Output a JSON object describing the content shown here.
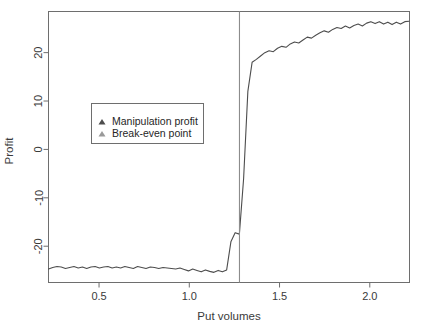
{
  "chart_data": {
    "type": "line",
    "title": "",
    "xlabel": "Put volumes",
    "ylabel": "Profit",
    "xlim": [
      0.22,
      2.22
    ],
    "ylim": [
      -27.5,
      28.5
    ],
    "xticks": [
      0.5,
      1.0,
      1.5,
      2.0
    ],
    "xtick_labels": [
      "0.5",
      "1.0",
      "1.5",
      "2.0"
    ],
    "yticks": [
      -20,
      -10,
      0,
      10,
      20
    ],
    "ytick_labels": [
      "-20",
      "-10",
      "0",
      "10",
      "20"
    ],
    "grid": false,
    "legend_position": "center-left",
    "series": [
      {
        "name": "Manipulation profit",
        "marker": "triangle",
        "color": "#4d4d4d",
        "x": [
          0.22,
          0.2435,
          0.267,
          0.2905,
          0.314,
          0.3375,
          0.361,
          0.3845,
          0.408,
          0.4315,
          0.455,
          0.4785,
          0.502,
          0.5255,
          0.549,
          0.5725,
          0.596,
          0.6195,
          0.643,
          0.6665,
          0.69,
          0.7135,
          0.737,
          0.7605,
          0.784,
          0.8075,
          0.831,
          0.8545,
          0.878,
          0.9015,
          0.925,
          0.9485,
          0.972,
          0.9955,
          1.019,
          1.0425,
          1.066,
          1.0895,
          1.113,
          1.1365,
          1.16,
          1.1835,
          1.207,
          1.2305,
          1.254,
          1.2775,
          1.301,
          1.3245,
          1.348,
          1.3715,
          1.395,
          1.4185,
          1.442,
          1.4655,
          1.489,
          1.5125,
          1.536,
          1.5595,
          1.583,
          1.6065,
          1.63,
          1.6535,
          1.677,
          1.7005,
          1.724,
          1.7475,
          1.771,
          1.7945,
          1.818,
          1.8415,
          1.865,
          1.8885,
          1.912,
          1.9355,
          1.959,
          1.9825,
          2.006,
          2.0295,
          2.053,
          2.0765,
          2.1,
          2.1235,
          2.147,
          2.1705,
          2.194,
          2.2175
        ],
        "y": [
          -24.7,
          -24.4,
          -24.2,
          -24.3,
          -24.6,
          -24.4,
          -24.2,
          -24.5,
          -24.3,
          -24.6,
          -24.3,
          -24.2,
          -24.5,
          -24.3,
          -24.2,
          -24.5,
          -24.3,
          -24.5,
          -24.2,
          -24.4,
          -24.6,
          -24.2,
          -24.4,
          -24.6,
          -24.3,
          -24.4,
          -24.6,
          -24.4,
          -24.5,
          -24.6,
          -24.7,
          -24.5,
          -24.8,
          -25.1,
          -24.7,
          -25.0,
          -25.3,
          -24.9,
          -25.2,
          -25.4,
          -25.0,
          -25.3,
          -24.9,
          -19.1,
          -17.2,
          -17.5,
          -6.0,
          12.0,
          18.0,
          18.6,
          19.3,
          20.0,
          20.4,
          20.2,
          20.9,
          21.3,
          21.1,
          21.8,
          22.2,
          22.0,
          22.6,
          23.2,
          23.0,
          23.6,
          24.1,
          24.5,
          24.2,
          24.8,
          25.2,
          25.0,
          25.5,
          25.1,
          25.6,
          25.9,
          25.5,
          26.1,
          26.4,
          26.0,
          26.4,
          25.9,
          26.3,
          25.8,
          26.3,
          25.9,
          26.4,
          26.5
        ]
      },
      {
        "name": "Break-even point",
        "marker": "triangle",
        "color": "#8c8c8c",
        "type": "vline",
        "x_value": 1.278
      }
    ],
    "annotations": []
  },
  "legend": {
    "items": [
      {
        "label": "Manipulation profit",
        "marker_color": "#4d4d4d"
      },
      {
        "label": "Break-even point",
        "marker_color": "#9a9a9a"
      }
    ]
  },
  "axes": {
    "x_title": "Put volumes",
    "y_title": "Profit",
    "x_tick_labels": [
      "0.5",
      "1.0",
      "1.5",
      "2.0"
    ],
    "y_tick_labels": [
      "20",
      "10",
      "0",
      "-10",
      "-20"
    ]
  },
  "colors": {
    "line": "#4d4d4d",
    "vline": "#8c8c8c",
    "frame": "#6e6e6e",
    "text": "#3a3a3a",
    "background": "#ffffff"
  }
}
